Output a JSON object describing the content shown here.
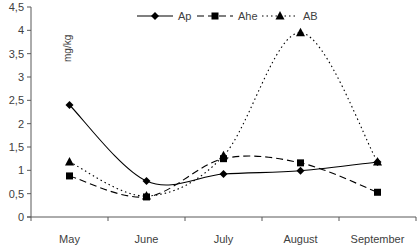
{
  "chart_data": {
    "type": "line",
    "title": "",
    "xlabel": "",
    "ylabel": "mg/kg",
    "categories": [
      "May",
      "June",
      "July",
      "August",
      "September"
    ],
    "ylim": [
      0,
      4.5
    ],
    "yticks": [
      "0",
      "0,5",
      "1",
      "1,5",
      "2",
      "2,5",
      "3",
      "3,5",
      "4",
      "4,5"
    ],
    "grid": false,
    "smooth": true,
    "legend_position": "top",
    "series": [
      {
        "name": "Ap",
        "marker": "diamond",
        "line": "solid",
        "values": [
          2.4,
          0.77,
          0.92,
          0.99,
          1.18
        ]
      },
      {
        "name": "Ahe",
        "marker": "square",
        "line": "dashed",
        "values": [
          0.88,
          0.43,
          1.25,
          1.16,
          0.53
        ]
      },
      {
        "name": "AB",
        "marker": "triangle",
        "line": "dotted",
        "values": [
          1.18,
          0.45,
          1.31,
          3.95,
          1.18
        ]
      }
    ]
  },
  "colors": {
    "series": "#000000",
    "axis": "#595959",
    "text": "#404040"
  }
}
